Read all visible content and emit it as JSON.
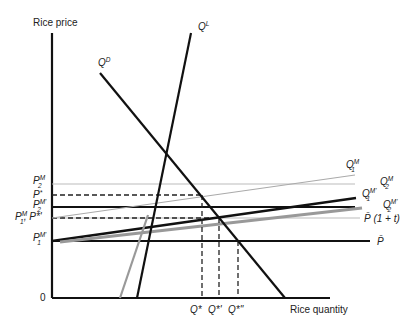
{
  "axes": {
    "y_label": "Rice price",
    "x_label": "Rice quantity",
    "origin_label": "0"
  },
  "curves": {
    "demand": {
      "label": "Q",
      "sup": "D",
      "color": "#111111"
    },
    "supply_local": {
      "label": "Q",
      "sup": "L",
      "color": "#111111"
    },
    "supply_local_shifted": {
      "color": "#999999"
    },
    "import_m1": {
      "label": "Q",
      "sup": "M",
      "sub": "1",
      "color": "#aaaaaa"
    },
    "import_m2": {
      "label": "Q",
      "sup": "M",
      "sub": "2",
      "color": "#cccccc"
    },
    "import_m1_prime": {
      "label": "Q",
      "sup": "M'",
      "sub": "1",
      "color": "#111111"
    },
    "import_m2_prime": {
      "label": "Q",
      "sup": "M'",
      "sub": "2",
      "color": "#999999"
    },
    "world_price": {
      "label": "P̄",
      "color": "#111111"
    },
    "world_price_tariff": {
      "label": "P̄ (1 + t)",
      "color": "#bbbbbb"
    }
  },
  "price_levels": [
    {
      "id": "pm2",
      "label": "P",
      "sup": "M",
      "sub": "2"
    },
    {
      "id": "pstar",
      "label": "P",
      "sup": "*",
      "sub": ""
    },
    {
      "id": "pm2prime",
      "label": "P",
      "sup": "M'",
      "sub": "2"
    },
    {
      "id": "pm1_pstarprime",
      "label": "P",
      "sup": "M",
      "sub": "1",
      "extra": ", P*'"
    },
    {
      "id": "pm1prime",
      "label": "P",
      "sup": "M'",
      "sub": "1"
    }
  ],
  "quantity_levels": [
    {
      "id": "qstar",
      "label": "Q*"
    },
    {
      "id": "qstarprime",
      "label": "Q*'"
    },
    {
      "id": "qstardoubleprime",
      "label": "Q*''"
    }
  ]
}
